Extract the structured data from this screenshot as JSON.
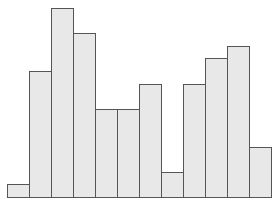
{
  "chart_data": {
    "type": "bar",
    "title": "",
    "xlabel": "",
    "ylabel": "",
    "categories": [
      "1",
      "2",
      "3",
      "4",
      "5",
      "6",
      "7",
      "8",
      "9",
      "10",
      "11",
      "12"
    ],
    "values": [
      1,
      10,
      15,
      13,
      7,
      7,
      9,
      2,
      9,
      11,
      12,
      4
    ],
    "ylim": [
      0,
      15
    ],
    "grid": false,
    "legend": null,
    "colors": {
      "fill": "#e8e8e8",
      "edge": "#555555",
      "background": "#ffffff"
    }
  },
  "layout": {
    "baseline_y": 197,
    "first_bar_x": 7,
    "bar_width": 22,
    "unit_px": 12.6
  }
}
